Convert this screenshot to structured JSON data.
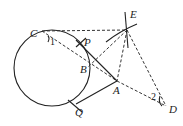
{
  "diagram": {
    "circle": {
      "cx": 52,
      "cy": 68,
      "r": 38
    },
    "points": [
      {
        "id": "C",
        "x": 42,
        "y": 31,
        "label": "C",
        "lx": 30,
        "ly": 37
      },
      {
        "id": "E",
        "x": 127,
        "y": 30,
        "label": "E",
        "lx": 130,
        "ly": 18
      },
      {
        "id": "P",
        "x": 82,
        "y": 44,
        "label": "P",
        "lx": 84,
        "ly": 46
      },
      {
        "id": "B",
        "x": 88,
        "y": 67,
        "label": "B",
        "lx": 80,
        "ly": 73
      },
      {
        "id": "A",
        "x": 117,
        "y": 81,
        "label": "A",
        "lx": 113,
        "ly": 94
      },
      {
        "id": "Q",
        "x": 76,
        "y": 104,
        "label": "Q",
        "lx": 75,
        "ly": 116
      },
      {
        "id": "D",
        "x": 166,
        "y": 106,
        "label": "D",
        "lx": 169,
        "ly": 113
      }
    ],
    "angle_labels": [
      {
        "text": "1",
        "x": 50,
        "y": 45
      },
      {
        "text": "2",
        "x": 151,
        "y": 100
      }
    ],
    "solid_segments": [
      [
        "B",
        "A"
      ],
      [
        "A",
        "Q"
      ],
      [
        "P",
        "B"
      ]
    ],
    "dashed_segments": [
      [
        "C",
        "E"
      ],
      [
        "C",
        "A"
      ],
      [
        "E",
        "B"
      ],
      [
        "E",
        "A"
      ],
      [
        "E",
        "D"
      ],
      [
        "A",
        "D"
      ]
    ]
  }
}
